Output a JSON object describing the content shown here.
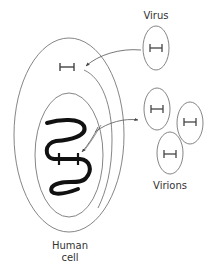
{
  "diagram": {
    "labels": {
      "virus": "Virus",
      "virions": "Virions",
      "human_cell_line1": "Human",
      "human_cell_line2": "cell"
    },
    "colors": {
      "line": "#555555",
      "dna": "#111111",
      "text": "#333333",
      "background": "#ffffff"
    },
    "nodes": [
      {
        "id": "virus",
        "label": "Virus",
        "shape": "ellipse"
      },
      {
        "id": "viral-genome-in-cytoplasm",
        "label": "",
        "shape": "H-glyph"
      },
      {
        "id": "human-cell",
        "label": "Human cell",
        "shape": "ellipse"
      },
      {
        "id": "nucleus",
        "label": "",
        "shape": "ellipse"
      },
      {
        "id": "host-dna",
        "label": "",
        "shape": "wavy-strand"
      },
      {
        "id": "integrated-viral-dna",
        "label": "",
        "shape": "H-glyph"
      },
      {
        "id": "virion-1",
        "label": "",
        "shape": "ellipse"
      },
      {
        "id": "virion-2",
        "label": "",
        "shape": "ellipse"
      },
      {
        "id": "virion-3",
        "label": "",
        "shape": "ellipse"
      }
    ],
    "edges": [
      {
        "from": "virus",
        "to": "viral-genome-in-cytoplasm",
        "type": "arrow"
      },
      {
        "from": "viral-genome-in-cytoplasm",
        "to": "integrated-viral-dna",
        "type": "arrow"
      },
      {
        "from": "integrated-viral-dna",
        "to": "virions",
        "type": "arrow"
      }
    ]
  }
}
